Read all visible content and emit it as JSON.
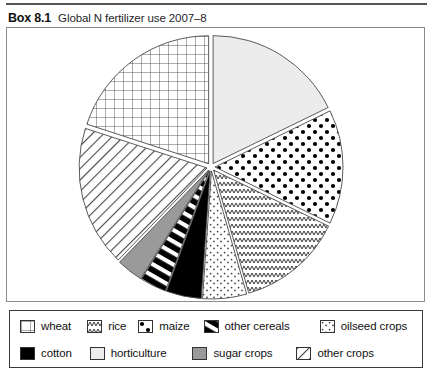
{
  "header": {
    "box_number": "Box 8.1",
    "title": "Global N fertilizer use 2007–8"
  },
  "chart_data": {
    "type": "pie",
    "title": "Global N fertilizer use 2007–8",
    "subtitle": "",
    "xlabel": "",
    "ylabel": "",
    "legend_position": "bottom",
    "exploded": true,
    "start_angle_deg": -90,
    "categories": [
      "horticulture",
      "maize",
      "rice",
      "oilseed crops",
      "cotton",
      "other cereals",
      "sugar crops",
      "other crops",
      "wheat"
    ],
    "values": [
      16,
      13,
      12,
      5,
      4,
      3,
      3,
      16,
      18
    ],
    "units": "percent of global N fertilizer use",
    "slices": [
      {
        "label": "horticulture",
        "value": 16,
        "pattern": "solid-light",
        "color": "#ececec"
      },
      {
        "label": "maize",
        "value": 13,
        "pattern": "dots-large",
        "color": "#ffffff"
      },
      {
        "label": "rice",
        "value": 12,
        "pattern": "zigzag",
        "color": "#ffffff"
      },
      {
        "label": "oilseed crops",
        "value": 5,
        "pattern": "stipple",
        "color": "#ffffff"
      },
      {
        "label": "cotton",
        "value": 4,
        "pattern": "solid-black",
        "color": "#000000"
      },
      {
        "label": "other cereals",
        "value": 3,
        "pattern": "black-stripes",
        "color": "#000000"
      },
      {
        "label": "sugar crops",
        "value": 3,
        "pattern": "solid-gray",
        "color": "#9a9a9a"
      },
      {
        "label": "other crops",
        "value": 16,
        "pattern": "diagonal",
        "color": "#ffffff"
      },
      {
        "label": "wheat",
        "value": 18,
        "pattern": "grid",
        "color": "#ffffff"
      }
    ]
  },
  "legend": {
    "row1": [
      {
        "label": "wheat",
        "pattern": "grid"
      },
      {
        "label": "rice",
        "pattern": "zigzag"
      },
      {
        "label": "maize",
        "pattern": "dots-large"
      },
      {
        "label": "other cereals",
        "pattern": "black-stripes"
      },
      {
        "label": "oilseed crops",
        "pattern": "stipple"
      }
    ],
    "row2": [
      {
        "label": "cotton",
        "pattern": "solid-black"
      },
      {
        "label": "horticulture",
        "pattern": "solid-light"
      },
      {
        "label": "sugar crops",
        "pattern": "solid-gray"
      },
      {
        "label": "other crops",
        "pattern": "diagonal"
      }
    ]
  },
  "colors": {
    "line": "#3a3a3a",
    "frame": "#8c8c8c",
    "light_fill": "#ececec",
    "gray_fill": "#9a9a9a",
    "black_fill": "#000000",
    "text": "#111111"
  },
  "footer": {
    "cut_text": ""
  }
}
